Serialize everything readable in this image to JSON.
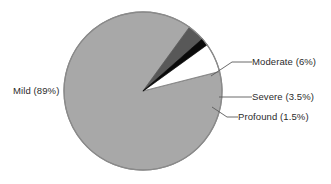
{
  "chart_data": {
    "type": "pie",
    "title": "",
    "subtitle": "",
    "xlabel": "",
    "ylabel": "",
    "legend_position": "none",
    "grid": false,
    "units": "percent",
    "total": 100,
    "categories": [
      "Mild",
      "Moderate",
      "Severe",
      "Profound"
    ],
    "values": [
      89,
      6,
      3.5,
      1.5
    ],
    "labels": [
      "Mild (89%)",
      "Moderate (6%)",
      "Severe (3.5%)",
      "Profound (1.5%)"
    ],
    "colors": [
      "#a8a8a8",
      "#ffffff",
      "#585858",
      "#0a0a0a"
    ],
    "slices": [
      {
        "name": "Mild",
        "label": "Mild (89%)",
        "value": 89,
        "color": "#a8a8a8",
        "start_angle": 12,
        "end_angle": 332.4,
        "label_placement": "outside-left",
        "leader_line": false
      },
      {
        "name": "Moderate",
        "label": "Moderate (6%)",
        "value": 6,
        "color": "#ffffff",
        "start_angle": 332.4,
        "end_angle": 353.999,
        "label_placement": "outside-right",
        "leader_line": true
      },
      {
        "name": "Severe",
        "label": "Severe (3.5%)",
        "value": 3.5,
        "color": "#585858",
        "start_angle": 354,
        "end_angle": 366.6,
        "label_placement": "outside-right",
        "leader_line": true
      },
      {
        "name": "Profound",
        "label": "Profound (1.5%)",
        "value": 1.5,
        "color": "#0a0a0a",
        "start_angle": 366.6,
        "end_angle": 372,
        "label_placement": "outside-right",
        "leader_line": true
      }
    ],
    "geometry": {
      "center_x": 143,
      "center_y": 91,
      "radius": 79,
      "outline_color": "#8a8a8a"
    }
  },
  "figure": {
    "background": "#ffffff",
    "text_color": "#2b2b2b",
    "leader_color": "#5a5a5a"
  }
}
